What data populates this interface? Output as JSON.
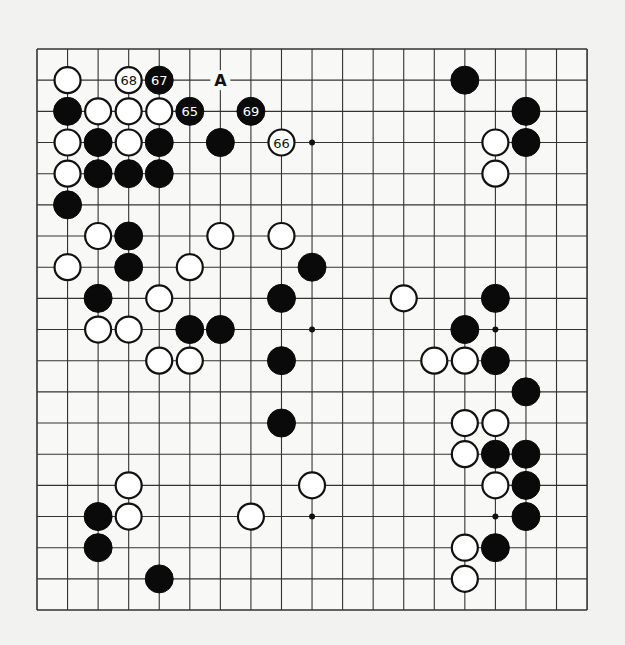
{
  "board": {
    "size": 19,
    "origin_x": 37,
    "origin_y": 49,
    "step_x": 30.56,
    "step_y": 31.17,
    "stone_radius": 14,
    "line_color": "#333333",
    "black_color": "#0a0a0a",
    "white_color": "#ffffff",
    "hoshi": [
      [
        9,
        3
      ],
      [
        9,
        9
      ],
      [
        15,
        9
      ],
      [
        9,
        15
      ],
      [
        15,
        15
      ]
    ]
  },
  "stones": [
    {
      "c": 1,
      "r": 1,
      "color": "white"
    },
    {
      "c": 3,
      "r": 1,
      "color": "white",
      "label": "68"
    },
    {
      "c": 4,
      "r": 1,
      "color": "black",
      "label": "67"
    },
    {
      "c": 14,
      "r": 1,
      "color": "black"
    },
    {
      "c": 1,
      "r": 2,
      "color": "black"
    },
    {
      "c": 2,
      "r": 2,
      "color": "white"
    },
    {
      "c": 3,
      "r": 2,
      "color": "white"
    },
    {
      "c": 4,
      "r": 2,
      "color": "white"
    },
    {
      "c": 5,
      "r": 2,
      "color": "black",
      "label": "65"
    },
    {
      "c": 7,
      "r": 2,
      "color": "black",
      "label": "69"
    },
    {
      "c": 16,
      "r": 2,
      "color": "black"
    },
    {
      "c": 1,
      "r": 3,
      "color": "white"
    },
    {
      "c": 2,
      "r": 3,
      "color": "black"
    },
    {
      "c": 3,
      "r": 3,
      "color": "white"
    },
    {
      "c": 4,
      "r": 3,
      "color": "black"
    },
    {
      "c": 6,
      "r": 3,
      "color": "black"
    },
    {
      "c": 8,
      "r": 3,
      "color": "white",
      "label": "66"
    },
    {
      "c": 15,
      "r": 3,
      "color": "white"
    },
    {
      "c": 16,
      "r": 3,
      "color": "black"
    },
    {
      "c": 1,
      "r": 4,
      "color": "white"
    },
    {
      "c": 2,
      "r": 4,
      "color": "black"
    },
    {
      "c": 3,
      "r": 4,
      "color": "black"
    },
    {
      "c": 4,
      "r": 4,
      "color": "black"
    },
    {
      "c": 15,
      "r": 4,
      "color": "white"
    },
    {
      "c": 1,
      "r": 5,
      "color": "black"
    },
    {
      "c": 2,
      "r": 6,
      "color": "white"
    },
    {
      "c": 3,
      "r": 6,
      "color": "black"
    },
    {
      "c": 6,
      "r": 6,
      "color": "white"
    },
    {
      "c": 8,
      "r": 6,
      "color": "white"
    },
    {
      "c": 1,
      "r": 7,
      "color": "white"
    },
    {
      "c": 3,
      "r": 7,
      "color": "black"
    },
    {
      "c": 5,
      "r": 7,
      "color": "white"
    },
    {
      "c": 9,
      "r": 7,
      "color": "black"
    },
    {
      "c": 2,
      "r": 8,
      "color": "black"
    },
    {
      "c": 4,
      "r": 8,
      "color": "white"
    },
    {
      "c": 8,
      "r": 8,
      "color": "black"
    },
    {
      "c": 12,
      "r": 8,
      "color": "white"
    },
    {
      "c": 15,
      "r": 8,
      "color": "black"
    },
    {
      "c": 2,
      "r": 9,
      "color": "white"
    },
    {
      "c": 3,
      "r": 9,
      "color": "white"
    },
    {
      "c": 5,
      "r": 9,
      "color": "black"
    },
    {
      "c": 6,
      "r": 9,
      "color": "black"
    },
    {
      "c": 14,
      "r": 9,
      "color": "black"
    },
    {
      "c": 4,
      "r": 10,
      "color": "white"
    },
    {
      "c": 5,
      "r": 10,
      "color": "white"
    },
    {
      "c": 8,
      "r": 10,
      "color": "black"
    },
    {
      "c": 13,
      "r": 10,
      "color": "white"
    },
    {
      "c": 14,
      "r": 10,
      "color": "white"
    },
    {
      "c": 15,
      "r": 10,
      "color": "black"
    },
    {
      "c": 16,
      "r": 11,
      "color": "black"
    },
    {
      "c": 8,
      "r": 12,
      "color": "black"
    },
    {
      "c": 14,
      "r": 12,
      "color": "white"
    },
    {
      "c": 15,
      "r": 12,
      "color": "white"
    },
    {
      "c": 14,
      "r": 13,
      "color": "white"
    },
    {
      "c": 15,
      "r": 13,
      "color": "black"
    },
    {
      "c": 16,
      "r": 13,
      "color": "black"
    },
    {
      "c": 3,
      "r": 14,
      "color": "white"
    },
    {
      "c": 9,
      "r": 14,
      "color": "white"
    },
    {
      "c": 15,
      "r": 14,
      "color": "white"
    },
    {
      "c": 16,
      "r": 14,
      "color": "black"
    },
    {
      "c": 2,
      "r": 15,
      "color": "black"
    },
    {
      "c": 3,
      "r": 15,
      "color": "white"
    },
    {
      "c": 7,
      "r": 15,
      "color": "white"
    },
    {
      "c": 16,
      "r": 15,
      "color": "black"
    },
    {
      "c": 2,
      "r": 16,
      "color": "black"
    },
    {
      "c": 14,
      "r": 16,
      "color": "white"
    },
    {
      "c": 15,
      "r": 16,
      "color": "black"
    },
    {
      "c": 4,
      "r": 17,
      "color": "black"
    },
    {
      "c": 14,
      "r": 17,
      "color": "white"
    }
  ],
  "markers": [
    {
      "c": 6,
      "r": 1,
      "label": "A"
    }
  ]
}
